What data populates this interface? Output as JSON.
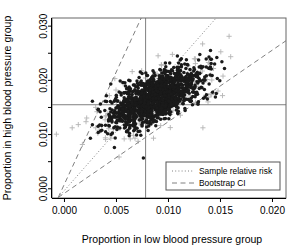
{
  "chart_data": {
    "type": "scatter",
    "title": "",
    "xlabel": "Proportion in low blood pressure group",
    "ylabel": "Proportion in high blood pressure group",
    "xlim": [
      -0.0012,
      0.0213
    ],
    "ylim": [
      -0.0017,
      0.0315
    ],
    "xticks": [
      0.0,
      0.005,
      0.01,
      0.015,
      0.02
    ],
    "xticklabels": [
      "0.000",
      "0.005",
      "0.010",
      "0.015",
      "0.020"
    ],
    "yticks": [
      0.0,
      0.005,
      0.01,
      0.015,
      0.02,
      0.025,
      0.03
    ],
    "yticklabels": [
      "0.000",
      "",
      "0.010",
      "",
      "0.020",
      "",
      "0.030"
    ],
    "ytick_labeled": [
      0.0,
      0.01,
      0.02,
      0.03
    ],
    "grid": false,
    "legend_position": "lower right",
    "series": [
      {
        "name": "bootstrap-cloud-dark",
        "marker": "filled-circle",
        "color": "#1a1a1a",
        "point_count": 1400,
        "center": [
          0.0088,
          0.0168
        ],
        "spread": [
          0.0021,
          0.0027
        ],
        "correlation": 0.62
      },
      {
        "name": "bootstrap-cloud-gray-plus",
        "marker": "plus",
        "color": "#b4b4b4",
        "point_count": 200,
        "center": [
          0.0088,
          0.0168
        ],
        "spread": [
          0.0031,
          0.0039
        ],
        "correlation": 0.62
      }
    ],
    "reference_lines": {
      "vertical_x": 0.0078,
      "horizontal_y": 0.0155,
      "color": "#808080"
    },
    "fitted_lines": [
      {
        "name": "sample-relative-risk",
        "style": "dotted",
        "color": "#808080",
        "origin": [
          -0.0006,
          -0.0016
        ],
        "slope": 2.18
      },
      {
        "name": "bootstrap-ci-upper",
        "style": "dashed",
        "color": "#808080",
        "origin": [
          -0.0006,
          -0.0016
        ],
        "slope": 4.15
      },
      {
        "name": "bootstrap-ci-lower",
        "style": "dashed",
        "color": "#808080",
        "origin": [
          -0.0006,
          -0.0016
        ],
        "slope": 1.32
      }
    ]
  },
  "legend": {
    "items": [
      {
        "label": "Sample relative risk",
        "style": "dotted"
      },
      {
        "label": "Bootstrap CI",
        "style": "dashed"
      }
    ]
  }
}
